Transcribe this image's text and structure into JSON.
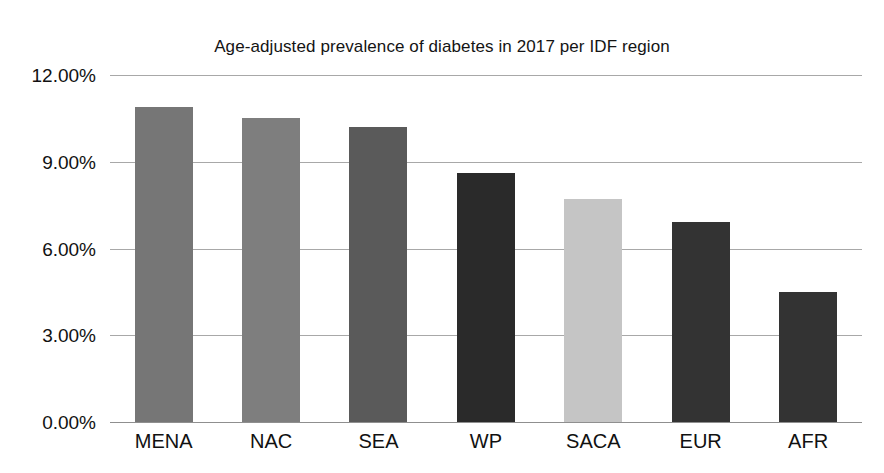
{
  "chart_data": {
    "type": "bar",
    "title": "Age-adjusted prevalence of diabetes in 2017 per IDF region",
    "xlabel": "",
    "ylabel": "",
    "categories": [
      "MENA",
      "NAC",
      "SEA",
      "WP",
      "SACA",
      "EUR",
      "AFR"
    ],
    "values": [
      10.9,
      10.5,
      10.2,
      8.6,
      7.7,
      6.9,
      4.5
    ],
    "value_labels": [
      "10.90%",
      "10.50%",
      "10.20%",
      "8.60%",
      "7.70%",
      "6.90%",
      "4.50%"
    ],
    "ylim": [
      0,
      12
    ],
    "ytick_values": [
      12,
      9,
      6,
      3,
      0
    ],
    "ytick_labels": [
      "12.00%",
      "9.00%",
      "6.00%",
      "3.00%",
      "0.00%"
    ],
    "grid": true,
    "gridline_color": "#a8a8a8",
    "axis_color": "#8f8f8f",
    "legend": "none",
    "legend_position": "none",
    "bar_colors": [
      "#767676",
      "#7e7e7e",
      "#5a5a5a",
      "#2a2a2a",
      "#c5c5c5",
      "#333333",
      "#333333"
    ],
    "background_color": "#ffffff",
    "text_color": "#111111"
  }
}
